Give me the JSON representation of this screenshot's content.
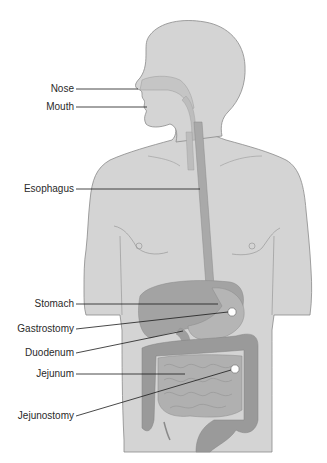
{
  "diagram": {
    "colors": {
      "background": "#ffffff",
      "skin": "#d4d4d4",
      "outline": "#8a8a8a",
      "airway": "#c9c9c9",
      "esophagus": "#a9a9a9",
      "liver": "#a3a3a3",
      "stomach": "#b5b5b5",
      "intestine": "#b0b0b0",
      "colon": "#9a9a9a",
      "stoma_fill": "#ffffff",
      "leader_line": "#1a1a1a",
      "label_text": "#2a2a2a"
    },
    "labels": [
      {
        "id": "nose",
        "text": "Nose"
      },
      {
        "id": "mouth",
        "text": "Mouth"
      },
      {
        "id": "esophagus",
        "text": "Esophagus"
      },
      {
        "id": "stomach",
        "text": "Stomach"
      },
      {
        "id": "gastrostomy",
        "text": "Gastrostomy"
      },
      {
        "id": "duodenum",
        "text": "Duodenum"
      },
      {
        "id": "jejunum",
        "text": "Jejunum"
      },
      {
        "id": "jejunostomy",
        "text": "Jejunostomy"
      }
    ]
  }
}
